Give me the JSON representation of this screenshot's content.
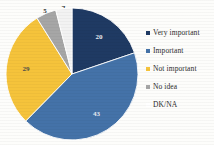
{
  "chart_data": {
    "type": "pie",
    "title": "",
    "categories": [
      "Very important",
      "Important",
      "Not important",
      "No idea",
      "DK/NA"
    ],
    "values": [
      20,
      43,
      29,
      5,
      4
    ],
    "colors": [
      "#1f3a63",
      "#4472a8",
      "#f5c33b",
      "#a6a6a6",
      "#f2f2f2"
    ],
    "legend_position": "right",
    "grid": false,
    "data_labels": [
      "20",
      "43",
      "29",
      "5",
      "4"
    ],
    "slices": [
      {
        "label": "Very important",
        "value": 20,
        "display": "20",
        "color": "#1f3a63",
        "label_color": "#e8ecf2",
        "label_inside": true
      },
      {
        "label": "Important",
        "value": 43,
        "display": "43",
        "color": "#4472a8",
        "label_color": "#e8ecf2",
        "label_inside": true
      },
      {
        "label": "Not important",
        "value": 29,
        "display": "29",
        "color": "#f5c33b",
        "label_color": "#4a4a4a",
        "label_inside": true
      },
      {
        "label": "No idea",
        "value": 5,
        "display": "5",
        "color": "#a6a6a6",
        "label_color": "#3b3b3b",
        "label_inside": false
      },
      {
        "label": "DK/NA",
        "value": 4,
        "display": "4",
        "color": "#f2f2f2",
        "label_color": "#3b3b3b",
        "label_inside": false
      }
    ]
  },
  "legend": {
    "items": [
      {
        "label": "Very important",
        "color": "#1f3a63"
      },
      {
        "label": "Important",
        "color": "#4472a8"
      },
      {
        "label": "Not important",
        "color": "#f5c33b"
      },
      {
        "label": "No idea",
        "color": "#a6a6a6"
      },
      {
        "label": "DK/NA",
        "color": "#f2f2f2"
      }
    ]
  }
}
